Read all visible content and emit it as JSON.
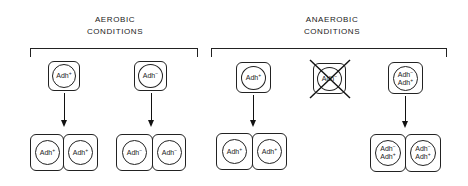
{
  "groups": [
    {
      "id": "aerobic",
      "label_line1": "AEROBIC",
      "label_line2": "CONDITIONS",
      "lineages": [
        {
          "parent": {
            "genotype": [
              "Adh",
              "+"
            ]
          },
          "survives": true,
          "daughters": [
            {
              "genotype": [
                "Adh",
                "+"
              ]
            },
            {
              "genotype": [
                "Adh",
                "+"
              ]
            }
          ]
        },
        {
          "parent": {
            "genotype": [
              "Adh",
              "−"
            ]
          },
          "survives": true,
          "daughters": [
            {
              "genotype": [
                "Adh",
                "−"
              ]
            },
            {
              "genotype": [
                "Adh",
                "−"
              ]
            }
          ]
        }
      ]
    },
    {
      "id": "anaerobic",
      "label_line1": "ANAEROBIC",
      "label_line2": "CONDITIONS",
      "lineages": [
        {
          "parent": {
            "genotype": [
              "Adh",
              "+"
            ]
          },
          "survives": true,
          "daughters": [
            {
              "genotype": [
                "Adh",
                "+"
              ]
            },
            {
              "genotype": [
                "Adh",
                "+"
              ]
            }
          ]
        },
        {
          "parent": {
            "genotype": [
              "Adh",
              "−"
            ]
          },
          "survives": false,
          "daughters": []
        },
        {
          "parent": {
            "line1": [
              "Adh",
              "−"
            ],
            "line2": [
              "Adh",
              "+"
            ]
          },
          "survives": true,
          "daughters": [
            {
              "line1": [
                "Adh",
                "−"
              ],
              "line2": [
                "Adh",
                "+"
              ]
            },
            {
              "line1": [
                "Adh",
                "−"
              ],
              "line2": [
                "Adh",
                "+"
              ]
            }
          ]
        }
      ]
    }
  ],
  "text": {
    "aerobic_l1": "AEROBIC",
    "aerobic_l2": "CONDITIONS",
    "anaerobic_l1": "ANAEROBIC",
    "anaerobic_l2": "CONDITIONS",
    "adh": "Adh",
    "plus": "+",
    "minus": "−"
  }
}
